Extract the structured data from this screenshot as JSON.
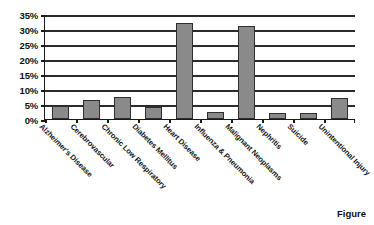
{
  "caption": "Figure",
  "chart_data": {
    "type": "bar",
    "title": "",
    "subtitle": "",
    "xlabel": "",
    "ylabel": "",
    "ylim": [
      0,
      35
    ],
    "ytick_step": 5,
    "ytick_labels": [
      "35%",
      "30%",
      "25%",
      "20%",
      "15%",
      "10%",
      "5%",
      "0%"
    ],
    "ytick_values": [
      35,
      30,
      25,
      20,
      15,
      10,
      5,
      0
    ],
    "grid": true,
    "legend": "none",
    "value_suffix": "%",
    "bar_color": "#8a8a8a",
    "bar_border_color": "#2e2e2e",
    "axis_color": "#1a1a1a",
    "categories": [
      "Alzheimer's Disease",
      "Cerebrovascular",
      "Chronic Low Respiratory",
      "Diabetes Mellitus",
      "Heart Disease",
      "Influenza & Pneumonia",
      "Malignant Neoplasms",
      "Nephritis",
      "Suicide",
      "Unintentional Injury"
    ],
    "values": [
      4.5,
      6.5,
      7.5,
      4.0,
      32.0,
      2.5,
      31.0,
      2.0,
      2.0,
      7.0
    ]
  }
}
